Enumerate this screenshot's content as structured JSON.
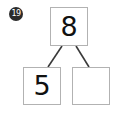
{
  "worksheet": {
    "question_number": "19",
    "type": "number-bond",
    "background_color": "#ffffff",
    "box_border_color": "#b2b2b2",
    "line_color": "#3a3a3a",
    "text_color": "#111111",
    "badge_color": "#2b2b2b"
  },
  "number_bond": {
    "whole": {
      "label": "8",
      "filled": true
    },
    "part_left": {
      "label": "5",
      "filled": true
    },
    "part_right": {
      "label": "",
      "filled": false
    }
  }
}
